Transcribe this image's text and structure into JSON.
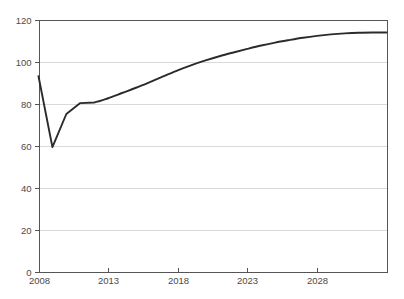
{
  "chart_data": {
    "type": "line",
    "title": "",
    "subtitle": "",
    "xlabel": "",
    "ylabel": "",
    "xlim": [
      2008,
      2033
    ],
    "ylim": [
      0,
      120
    ],
    "grid": true,
    "legend": null,
    "legend_position": "none",
    "x_tick_labels": [
      "2008",
      "2013",
      "2018",
      "2023",
      "2028"
    ],
    "x_tick_values": [
      2008,
      2013,
      2018,
      2023,
      2028
    ],
    "y_tick_labels": [
      "0",
      "20",
      "40",
      "60",
      "80",
      "100",
      "120"
    ],
    "y_tick_values": [
      0,
      20,
      40,
      60,
      80,
      100,
      120
    ],
    "series": [
      {
        "name": "index",
        "color": "#2b2b2b",
        "x": [
          2008,
          2009,
          2010,
          2011,
          2012,
          2013,
          2014,
          2015,
          2016,
          2017,
          2018,
          2019,
          2020,
          2021,
          2022,
          2023,
          2024,
          2025,
          2026,
          2027,
          2028,
          2029,
          2030,
          2031,
          2032,
          2033
        ],
        "values": [
          93.0,
          59.2,
          75.0,
          80.2,
          80.5,
          82.5,
          85.0,
          87.5,
          90.2,
          93.0,
          95.8,
          98.3,
          100.5,
          102.5,
          104.3,
          106.0,
          107.6,
          109.0,
          110.2,
          111.3,
          112.2,
          112.9,
          113.4,
          113.7,
          113.8,
          113.8
        ]
      }
    ],
    "annotations": []
  },
  "colors": {
    "line": "#2b2b2b",
    "gridline": "#d9d9d9",
    "axis": "#555555",
    "tick_text": "#4a4a4a",
    "background": "#ffffff"
  }
}
